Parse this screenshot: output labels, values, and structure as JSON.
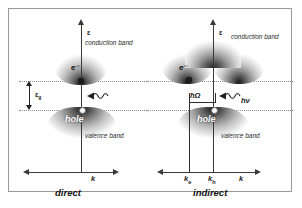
{
  "figure": {
    "type": "band-structure-diagram"
  },
  "panels": [
    {
      "id": "direct",
      "caption": "direct",
      "energy_axis_label": "ε",
      "k_axis_label": "k",
      "conduction_band_label": "conduction band",
      "valence_band_label": "valence band",
      "hole_label": "hole",
      "electron_label": "e⁻",
      "gap_label": "ε",
      "gap_sub": "g",
      "photon_label": "",
      "k_ticks": [],
      "band_shape": "single-valley",
      "transition": "vertical photon absorption, no momentum change"
    },
    {
      "id": "indirect",
      "caption": "indirect",
      "energy_axis_label": "ε",
      "k_axis_label": "k",
      "conduction_band_label": "conduction band",
      "valence_band_label": "valence band",
      "hole_label": "hole",
      "electron_label": "e⁻",
      "phonon_label": "ħΩ",
      "photon_label": "hν",
      "k_ticks": [
        {
          "label": "k",
          "sub": "e"
        },
        {
          "label": "k",
          "sub": "h"
        }
      ],
      "band_shape": "double-valley",
      "transition": "photon absorption assisted by phonon momentum transfer"
    }
  ],
  "colors": {
    "frame": "#9a9a9a",
    "axis": "#3a3a3a",
    "guide": "#8d8d8d",
    "band_dark": "#1b1b1b",
    "electron": "#1d1d1d",
    "hole_fill": "#fbfbfb",
    "text": "#1a1a1a",
    "hole_text": "#ffffff",
    "background": "#ffffff"
  }
}
